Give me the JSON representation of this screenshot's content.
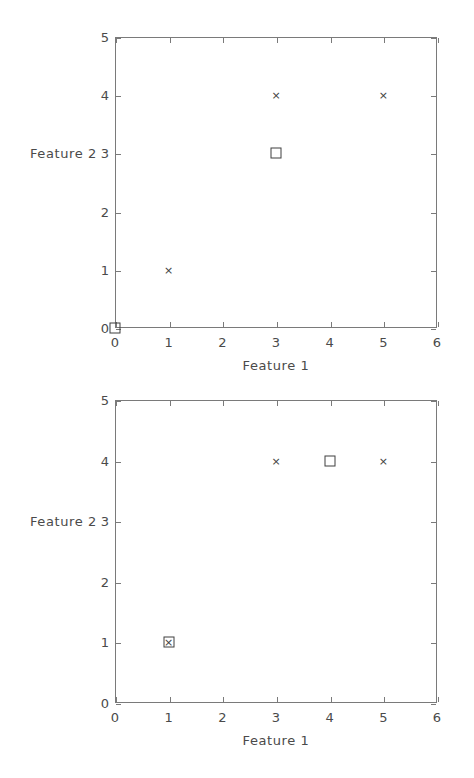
{
  "figure": {
    "background_color": "#ffffff",
    "axis_color": "#7a7a7a",
    "marker_color": "#3f3f3f",
    "text_color": "#4a4a4a"
  },
  "chart_data": [
    {
      "type": "scatter",
      "title": "",
      "xlabel": "Feature 1",
      "ylabel": "Feature 2",
      "xlim": [
        0,
        6
      ],
      "ylim": [
        0,
        5
      ],
      "xticks": [
        0,
        1,
        2,
        3,
        4,
        5,
        6
      ],
      "yticks": [
        0,
        1,
        2,
        3,
        4,
        5
      ],
      "xtick_labels": [
        "0",
        "1",
        "2",
        "3",
        "4",
        "5",
        "6"
      ],
      "ytick_labels": [
        "0",
        "1",
        "2",
        "3",
        "4",
        "5"
      ],
      "grid": false,
      "legend": "none",
      "series": [
        {
          "name": "data points",
          "marker": "x",
          "points": [
            {
              "x": 1,
              "y": 1
            },
            {
              "x": 3,
              "y": 4
            },
            {
              "x": 5,
              "y": 4
            }
          ]
        },
        {
          "name": "centroids",
          "marker": "square",
          "points": [
            {
              "x": 0,
              "y": 0
            },
            {
              "x": 3,
              "y": 3
            }
          ]
        }
      ]
    },
    {
      "type": "scatter",
      "title": "",
      "xlabel": "Feature 1",
      "ylabel": "Feature 2",
      "xlim": [
        0,
        6
      ],
      "ylim": [
        0,
        5
      ],
      "xticks": [
        0,
        1,
        2,
        3,
        4,
        5,
        6
      ],
      "yticks": [
        0,
        1,
        2,
        3,
        4,
        5
      ],
      "xtick_labels": [
        "0",
        "1",
        "2",
        "3",
        "4",
        "5",
        "6"
      ],
      "ytick_labels": [
        "0",
        "1",
        "2",
        "3",
        "4",
        "5"
      ],
      "grid": false,
      "legend": "none",
      "series": [
        {
          "name": "data points",
          "marker": "x",
          "points": [
            {
              "x": 1,
              "y": 1
            },
            {
              "x": 3,
              "y": 4
            },
            {
              "x": 5,
              "y": 4
            }
          ]
        },
        {
          "name": "centroids",
          "marker": "square",
          "points": [
            {
              "x": 1,
              "y": 1
            },
            {
              "x": 4,
              "y": 4
            }
          ]
        }
      ]
    }
  ],
  "glyphs": {
    "cross": "×"
  }
}
